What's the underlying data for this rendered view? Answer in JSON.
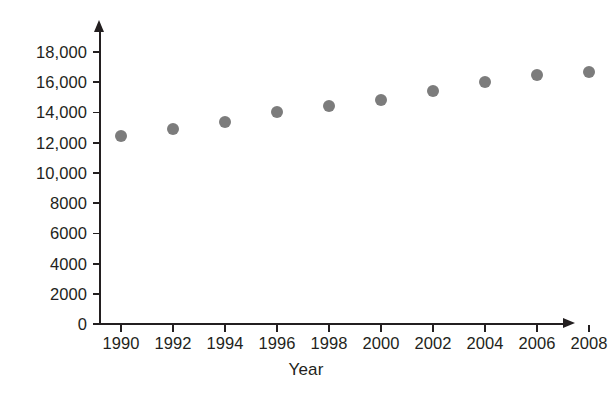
{
  "chart_data": {
    "type": "scatter",
    "title": "",
    "xlabel": "Year",
    "ylabel": "",
    "x": [
      1990,
      1992,
      1994,
      1996,
      1998,
      2000,
      2002,
      2004,
      2006,
      2008
    ],
    "values": [
      12450,
      12900,
      13350,
      14000,
      14450,
      14800,
      15400,
      16000,
      16450,
      16650
    ],
    "series": [
      {
        "name": "",
        "values": [
          12450,
          12900,
          13350,
          14000,
          14450,
          14800,
          15400,
          16000,
          16450,
          16650
        ]
      }
    ],
    "xtick_labels": [
      "1990",
      "1992",
      "1994",
      "1996",
      "1998",
      "2000",
      "2002",
      "2004",
      "2006",
      "2008"
    ],
    "ytick_values": [
      0,
      2000,
      4000,
      6000,
      8000,
      10000,
      12000,
      14000,
      16000,
      18000
    ],
    "ytick_labels": [
      "0",
      "2000",
      "4000",
      "6000",
      "8000",
      "10,000",
      "12,000",
      "14,000",
      "16,000",
      "18,000"
    ],
    "xlim": [
      1989,
      2009
    ],
    "ylim": [
      0,
      18000
    ],
    "grid": false,
    "legend": false,
    "marker_color": "#7c7c7c",
    "axis_color": "#231f20",
    "background_color": "#ffffff"
  }
}
